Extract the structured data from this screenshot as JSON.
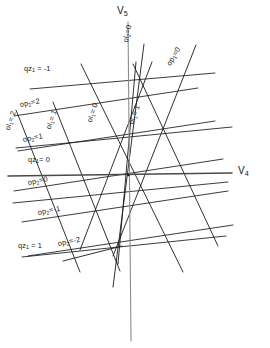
{
  "figure": {
    "background": "#ffffff",
    "ink_color": "#1a1a1a",
    "axis_color": "#4a4a4a",
    "width": 270,
    "height": 348
  },
  "axes": {
    "horizontal": {
      "name": "V4",
      "base": "V",
      "subscript": "4",
      "x1": 8,
      "y1": 176,
      "x2": 232,
      "y2": 173
    },
    "vertical": {
      "name": "V5",
      "base": "V",
      "subscript": "5",
      "x1": 128,
      "y1": 22,
      "x2": 131,
      "y2": 341
    }
  },
  "axis_labels": [
    {
      "id": "v5-label",
      "base": "V",
      "subscript": "5",
      "x": 118,
      "y": 8
    },
    {
      "id": "v4-label",
      "base": "V",
      "subscript": "4",
      "x": 238,
      "y": 168
    }
  ],
  "line_families": [
    {
      "id": "qz1",
      "name": "qz1-family",
      "param": "qz",
      "param_subscript": "1",
      "description": "shallow near-horizontal family",
      "members": [
        {
          "value": "-1",
          "label": "qz₁ = -1"
        },
        {
          "value": "0",
          "label": "qz₁ = 0"
        },
        {
          "value": "1",
          "label": "qz₁ = 1"
        }
      ]
    },
    {
      "id": "op2",
      "name": "op2-family",
      "param": "op",
      "param_subscript": "2",
      "description": "gently rising family",
      "members": [
        {
          "value": "2",
          "label": "op₂ = 2"
        },
        {
          "value": "1",
          "label": "op₂ = 1"
        },
        {
          "value": "0",
          "label": "op₂ = 0"
        },
        {
          "value": "-1",
          "label": "op₂ = -1"
        },
        {
          "value": "-2",
          "label": "op₂ = -2"
        }
      ]
    },
    {
      "id": "ol1",
      "name": "ol1-family",
      "param": "ol",
      "param_subscript": "1",
      "description": "steep descending family",
      "members": [
        {
          "value": "2",
          "label": "ol₁ = 2"
        },
        {
          "value": "1",
          "label": "ol₁ = 1"
        },
        {
          "value": "0",
          "label": "ol₁ = 0"
        }
      ]
    },
    {
      "id": "op1",
      "name": "op1-family",
      "param": "op",
      "param_subscript": "1",
      "description": "steep ascending family",
      "members": [
        {
          "value": "0",
          "label": "op₁ = 0"
        }
      ]
    },
    {
      "id": "ol2",
      "name": "ol2-family",
      "param": "ol",
      "param_subscript": "2",
      "description": "near vertical family",
      "members": [
        {
          "value": "0",
          "label": "ol₂ = 0"
        }
      ]
    }
  ],
  "labels": [
    {
      "id": "qz1-neg1",
      "text": "qz",
      "sub": "1",
      "tail": " = -1",
      "x": 24,
      "y": 68,
      "rot": 0
    },
    {
      "id": "op2-2",
      "text": "op",
      "sub": "2",
      "tail": "=2",
      "x": 20,
      "y": 104,
      "rot": -11
    },
    {
      "id": "ol1-2",
      "text": "ol",
      "sub": "1",
      "tail": "= 2",
      "x": 9,
      "y": 120,
      "rot": -72
    },
    {
      "id": "ol1-1",
      "text": "ol",
      "sub": "1",
      "tail": "= 1",
      "x": 50,
      "y": 118,
      "rot": -72
    },
    {
      "id": "ol1-0",
      "text": "ol",
      "sub": "1",
      "tail": "= 0",
      "x": 91,
      "y": 110,
      "rot": -72
    },
    {
      "id": "op2-1",
      "text": "op",
      "sub": "2",
      "tail": "=1",
      "x": 23,
      "y": 139,
      "rot": -11
    },
    {
      "id": "qz1-0",
      "text": "qz",
      "sub": "1",
      "tail": "= 0",
      "x": 28,
      "y": 159,
      "rot": 0
    },
    {
      "id": "op2-0",
      "text": "op",
      "sub": "2",
      "tail": "=0",
      "x": 28,
      "y": 182,
      "rot": -11
    },
    {
      "id": "op2-neg1",
      "text": "op",
      "sub": "2",
      "tail": "=-1",
      "x": 38,
      "y": 212,
      "rot": -11
    },
    {
      "id": "qz1-1",
      "text": "qz",
      "sub": "1",
      "tail": " = 1",
      "x": 18,
      "y": 245,
      "rot": 0
    },
    {
      "id": "op2-neg2",
      "text": "op",
      "sub": "2",
      "tail": "=-2",
      "x": 58,
      "y": 243,
      "rot": -11
    },
    {
      "id": "ol2-0",
      "text": "ol",
      "sub": "2",
      "tail": "=0",
      "x": 127,
      "y": 32,
      "rot": -78
    },
    {
      "id": "op1-0",
      "text": "op",
      "sub": "1",
      "tail": "=0",
      "x": 170,
      "y": 55,
      "rot": -60
    },
    {
      "id": "ol1-1b",
      "text": "ol",
      "sub": "1",
      "tail": "= 1",
      "x": 133,
      "y": 113,
      "rot": -72
    }
  ],
  "convergence_point": {
    "x": 128,
    "y": 175,
    "note": "all line families converge near the V4/V5 origin"
  }
}
